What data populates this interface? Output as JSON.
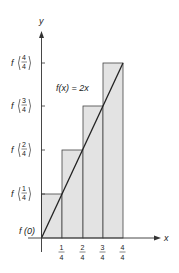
{
  "figure": {
    "function_label": "f(x) = 2x",
    "x_axis_label": "x",
    "y_axis_label": "y",
    "origin_label": "f (0)",
    "x_ticks": [
      {
        "num": "1",
        "den": "4"
      },
      {
        "num": "2",
        "den": "4"
      },
      {
        "num": "3",
        "den": "4"
      },
      {
        "num": "4",
        "den": "4"
      }
    ],
    "y_ticks": [
      {
        "prefix": "f",
        "num": "1",
        "den": "4"
      },
      {
        "prefix": "f",
        "num": "2",
        "den": "4"
      },
      {
        "prefix": "f",
        "num": "3",
        "den": "4"
      },
      {
        "prefix": "f",
        "num": "4",
        "den": "4"
      }
    ],
    "colors": {
      "bar_fill": "#e3e3e3",
      "stroke": "#222222"
    }
  }
}
